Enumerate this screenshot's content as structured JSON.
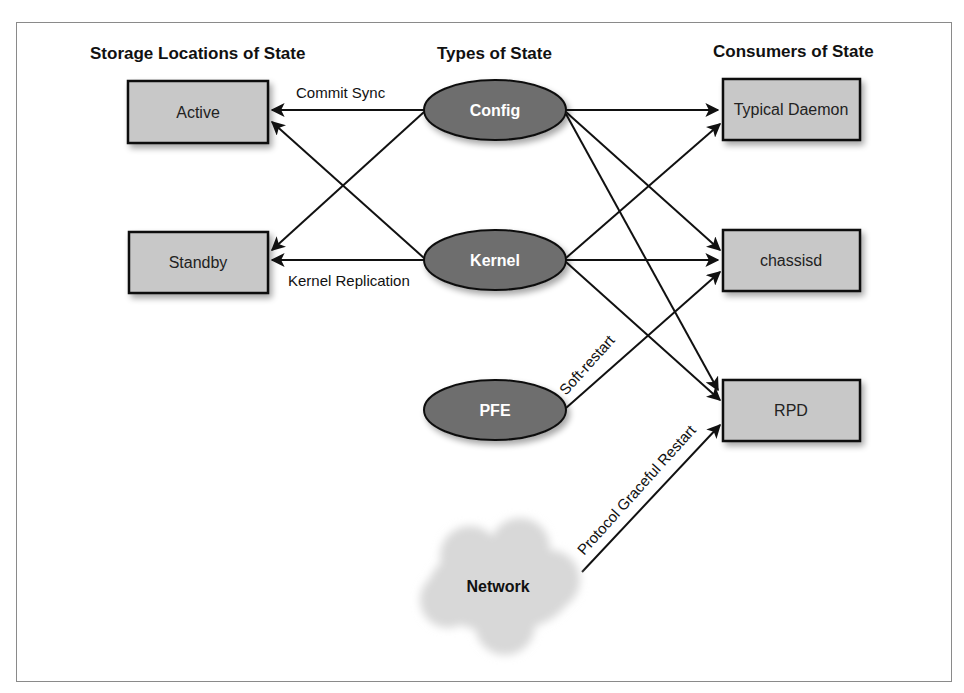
{
  "columns": {
    "storage": "Storage Locations of State",
    "types": "Types of State",
    "consumers": "Consumers of State"
  },
  "nodes": {
    "active": "Active",
    "standby": "Standby",
    "config": "Config",
    "kernel": "Kernel",
    "pfe": "PFE",
    "network": "Network",
    "typical_daemon": "Typical Daemon",
    "chassisd": "chassisd",
    "rpd": "RPD"
  },
  "edge_labels": {
    "commit_sync": "Commit Sync",
    "kernel_replication": "Kernel Replication",
    "soft_restart": "Soft-restart",
    "protocol_graceful_restart": "Protocol Graceful Restart"
  },
  "edges": [
    {
      "from": "Config",
      "to": "Active",
      "label": "Commit Sync"
    },
    {
      "from": "Config",
      "to": "Standby"
    },
    {
      "from": "Kernel",
      "to": "Active"
    },
    {
      "from": "Kernel",
      "to": "Standby",
      "label": "Kernel Replication"
    },
    {
      "from": "Config",
      "to": "Typical Daemon"
    },
    {
      "from": "Config",
      "to": "chassisd"
    },
    {
      "from": "Config",
      "to": "RPD"
    },
    {
      "from": "Kernel",
      "to": "Typical Daemon"
    },
    {
      "from": "Kernel",
      "to": "chassisd"
    },
    {
      "from": "Kernel",
      "to": "RPD"
    },
    {
      "from": "PFE",
      "to": "chassisd",
      "label": "Soft-restart"
    },
    {
      "from": "Network",
      "to": "RPD",
      "label": "Protocol Graceful Restart"
    }
  ],
  "colors": {
    "box_fill": "#c8c8c8",
    "ellipse_fill": "#6e6e6e",
    "cloud_fill": "#dcdcdc",
    "stroke": "#111111"
  }
}
